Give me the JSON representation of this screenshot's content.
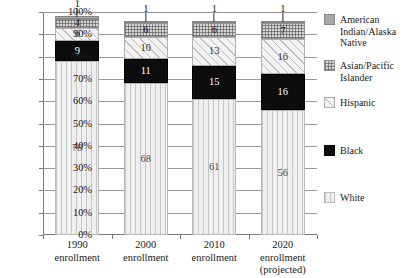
{
  "chart_data": {
    "type": "bar",
    "subtype": "stacked-100-percent",
    "title": "",
    "xlabel": "",
    "ylabel": "",
    "ylim": [
      0,
      100
    ],
    "ytick_labels": [
      "100%",
      "90%",
      "80%",
      "70%",
      "60%",
      "50%",
      "40%",
      "30%",
      "20%",
      "10%",
      "0%"
    ],
    "ytick_values": [
      100,
      90,
      80,
      70,
      60,
      50,
      40,
      30,
      20,
      10,
      0
    ],
    "grid": true,
    "legend_position": "right",
    "categories": [
      "1990 enrollment",
      "2000 enrollment",
      "2010 enrollment",
      "2020 enrollment (projected)"
    ],
    "category_lines": [
      [
        "1990",
        "enrollment"
      ],
      [
        "2000",
        "enrollment"
      ],
      [
        "2010",
        "enrollment"
      ],
      [
        "2020",
        "enrollment",
        "(projected)"
      ]
    ],
    "stack_order_bottom_to_top": [
      "White",
      "Black",
      "Hispanic",
      "Asian/Pacific Islander",
      "American Indian/Alaska Native"
    ],
    "series": [
      {
        "name": "White",
        "values": [
          78,
          68,
          61,
          56
        ],
        "pattern": "vertical-lines",
        "color": "#efefef"
      },
      {
        "name": "Black",
        "values": [
          9,
          11,
          15,
          16
        ],
        "pattern": "solid",
        "color": "#0d0d0d"
      },
      {
        "name": "Hispanic",
        "values": [
          6,
          10,
          13,
          16
        ],
        "pattern": "diagonal-hatch",
        "color": "#f3f3f3"
      },
      {
        "name": "Asian/Pacific Islander",
        "values": [
          4,
          6,
          6,
          7
        ],
        "pattern": "checkered",
        "color": "#d5d5d5"
      },
      {
        "name": "American Indian/Alaska Native",
        "values": [
          1,
          1,
          1,
          1
        ],
        "pattern": "solid-gray",
        "color": "#a8a8a8"
      }
    ]
  },
  "legend": {
    "items": [
      {
        "label": "American Indian/Alaska Native",
        "swatch": "legend-swatch-native"
      },
      {
        "label": "Asian/Pacific Islander",
        "swatch": "legend-swatch-asian"
      },
      {
        "label": "Hispanic",
        "swatch": "legend-swatch-hispanic"
      },
      {
        "label": "Black",
        "swatch": "legend-swatch-black"
      },
      {
        "label": "White",
        "swatch": "legend-swatch-white"
      }
    ]
  }
}
